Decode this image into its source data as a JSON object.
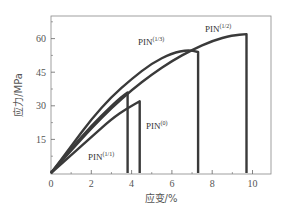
{
  "chart_data": {
    "type": "line",
    "title": "",
    "xlabel": "应变/%",
    "ylabel": "应力/MPa",
    "xlim": [
      0,
      11
    ],
    "ylim": [
      0,
      69
    ],
    "xticks": [
      0,
      2,
      4,
      6,
      8,
      10
    ],
    "yticks": [
      15,
      30,
      45,
      60
    ],
    "grid": false,
    "legend": "none (inline labels)",
    "series": [
      {
        "name": "PIN(1/2)",
        "label_base": "PIN",
        "label_sup": "(1/2)",
        "x": [
          0,
          1,
          2,
          3,
          4,
          5,
          6,
          7,
          8,
          9,
          9.7,
          9.7
        ],
        "y": [
          0,
          10,
          20,
          29,
          37,
          44,
          50,
          55,
          59,
          61.5,
          62,
          0
        ]
      },
      {
        "name": "PIN(1/3)",
        "label_base": "PIN",
        "label_sup": "(1/3)",
        "x": [
          0,
          1,
          2,
          3,
          4,
          5,
          6,
          6.8,
          7.3,
          7.3
        ],
        "y": [
          0,
          12,
          24,
          34,
          42,
          49,
          53.5,
          55,
          54,
          0
        ]
      },
      {
        "name": "PIN(1/1)",
        "label_base": "PIN",
        "label_sup": "(1/1)",
        "x": [
          0,
          1,
          2,
          3,
          3.5,
          3.8,
          3.8
        ],
        "y": [
          0,
          11,
          21,
          30,
          34,
          36,
          0
        ]
      },
      {
        "name": "PIN(0)",
        "label_base": "PIN",
        "label_sup": "(0)",
        "x": [
          0,
          1,
          2,
          3,
          3.8,
          4.4,
          4.4
        ],
        "y": [
          0,
          8,
          16,
          24,
          29,
          32,
          0
        ]
      }
    ]
  },
  "labels": {
    "y_ticks": [
      "15",
      "30",
      "45",
      "60"
    ],
    "x_ticks": [
      "0",
      "2",
      "4",
      "6",
      "8",
      "10"
    ],
    "xlabel": "应变/%",
    "ylabel": "应力/MPa"
  }
}
